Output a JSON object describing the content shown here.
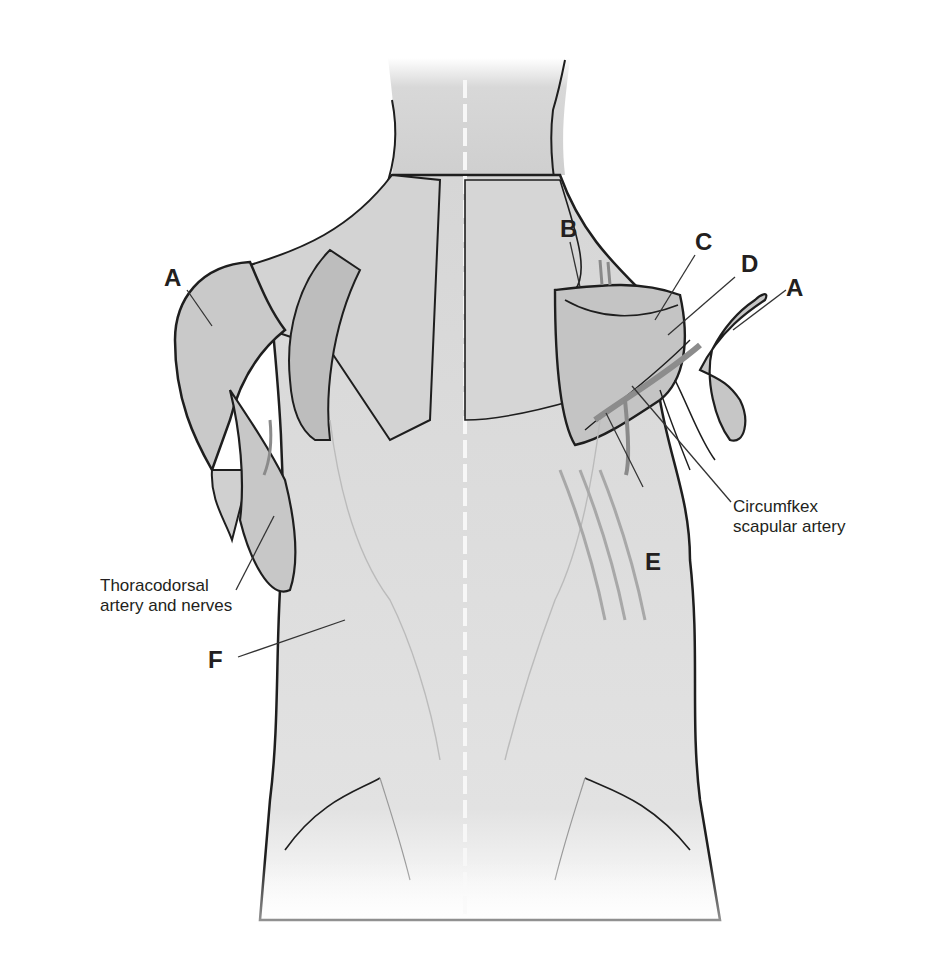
{
  "figure": {
    "colors": {
      "background": "#ffffff",
      "muscle_light": "#e6e6e6",
      "muscle_mid": "#cfcfcf",
      "muscle_dark": "#b5b5b5",
      "outline": "#1e1e1e",
      "label_text": "#231f20",
      "leader_line": "#333333"
    }
  },
  "labels": {
    "a_left": "A",
    "a_right": "A",
    "b": "B",
    "c": "C",
    "d": "D",
    "e": "E",
    "f": "F",
    "circumflex_line1": "Circumfkex",
    "circumflex_line2": "scapular artery",
    "thoracodorsal_line1": "Thoracodorsal",
    "thoracodorsal_line2": "artery and nerves"
  }
}
